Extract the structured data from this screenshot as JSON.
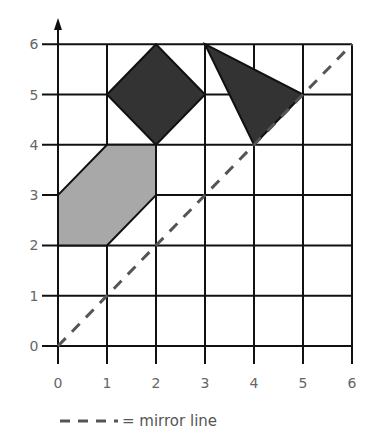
{
  "diagram": {
    "grid": {
      "xmin": 0,
      "xmax": 6,
      "ymin": 0,
      "ymax": 6
    },
    "x_ticks": [
      "0",
      "1",
      "2",
      "3",
      "4",
      "5",
      "6"
    ],
    "y_ticks": [
      "0",
      "1",
      "2",
      "3",
      "4",
      "5",
      "6"
    ],
    "shapes": [
      {
        "name": "square",
        "fill": "#333333",
        "points": [
          [
            2,
            6
          ],
          [
            3,
            5
          ],
          [
            2,
            4
          ],
          [
            1,
            5
          ]
        ]
      },
      {
        "name": "triangle",
        "fill": "#333333",
        "points": [
          [
            3,
            6
          ],
          [
            5,
            5
          ],
          [
            4,
            4
          ]
        ]
      },
      {
        "name": "hexagon",
        "fill": "#a8a8a8",
        "points": [
          [
            1,
            4
          ],
          [
            2,
            4
          ],
          [
            2,
            3
          ],
          [
            1,
            2
          ],
          [
            0,
            2
          ],
          [
            0,
            3
          ]
        ]
      }
    ],
    "mirror_line": {
      "from": [
        0,
        0
      ],
      "to": [
        6,
        6
      ],
      "color": "#555555"
    },
    "legend": {
      "label": "= mirror line"
    }
  }
}
